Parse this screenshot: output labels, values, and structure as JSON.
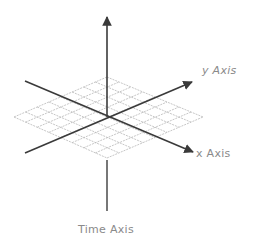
{
  "diagram": {
    "type": "3d-axes-with-grid-plane",
    "labels": {
      "y_axis": "y Axis",
      "x_axis": "x Axis",
      "time_axis": "Time Axis"
    },
    "colors": {
      "axis": "#3a3a3a",
      "grid": "#b8b8b8",
      "label": "#8a8a8a",
      "background": "#ffffff"
    },
    "grid": {
      "divisions": 8
    }
  }
}
